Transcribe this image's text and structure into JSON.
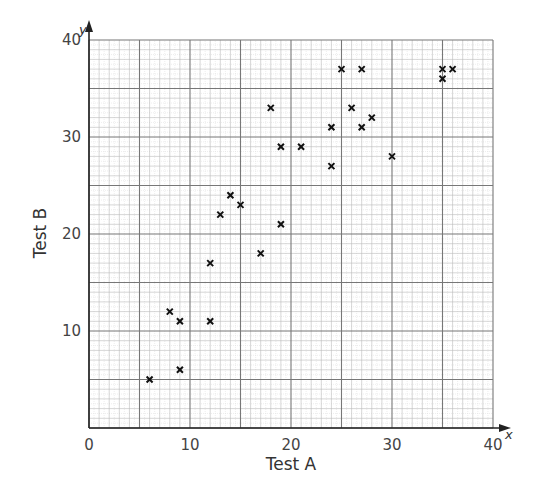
{
  "chart_data": {
    "type": "scatter",
    "title": "",
    "xlabel": "Test A",
    "ylabel": "Test B",
    "x_axis_var": "x",
    "y_axis_var": "y",
    "xlim": [
      0,
      40
    ],
    "ylim": [
      0,
      40
    ],
    "x_ticks": [
      0,
      10,
      20,
      30,
      40
    ],
    "y_ticks": [
      10,
      20,
      30,
      40
    ],
    "grid": {
      "major": 5,
      "minor": 1,
      "on": true
    },
    "marker": "x",
    "points": [
      {
        "x": 6,
        "y": 5
      },
      {
        "x": 8,
        "y": 12
      },
      {
        "x": 9,
        "y": 11
      },
      {
        "x": 9,
        "y": 6
      },
      {
        "x": 12,
        "y": 11
      },
      {
        "x": 12,
        "y": 17
      },
      {
        "x": 13,
        "y": 22
      },
      {
        "x": 14,
        "y": 24
      },
      {
        "x": 15,
        "y": 23
      },
      {
        "x": 17,
        "y": 18
      },
      {
        "x": 18,
        "y": 33
      },
      {
        "x": 19,
        "y": 29
      },
      {
        "x": 19,
        "y": 21
      },
      {
        "x": 21,
        "y": 29
      },
      {
        "x": 24,
        "y": 31
      },
      {
        "x": 24,
        "y": 27
      },
      {
        "x": 25,
        "y": 37
      },
      {
        "x": 26,
        "y": 33
      },
      {
        "x": 27,
        "y": 37
      },
      {
        "x": 27,
        "y": 31
      },
      {
        "x": 28,
        "y": 32
      },
      {
        "x": 30,
        "y": 28
      },
      {
        "x": 35,
        "y": 37
      },
      {
        "x": 35,
        "y": 36
      },
      {
        "x": 36,
        "y": 37
      }
    ]
  },
  "colors": {
    "axis": "#222222",
    "major_grid": "#777777",
    "minor_grid": "#bbbbbb",
    "marker": "#111111"
  }
}
